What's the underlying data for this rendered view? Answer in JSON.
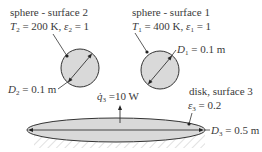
{
  "diagram": {
    "sphere2": {
      "title": "sphere - surface 2",
      "T_symbol": "T",
      "T_sub": "2",
      "T_value": " = 200 K, ",
      "eps_symbol": "ε",
      "eps_sub": "2",
      "eps_value": " = 1",
      "D_symbol": "D",
      "D_sub": "2",
      "D_value": " = 0.1 m"
    },
    "sphere1": {
      "title": "sphere - surface 1",
      "T_symbol": "T",
      "T_sub": "1",
      "T_value": " = 400 K, ",
      "eps_symbol": "ε",
      "eps_sub": "1",
      "eps_value": " = 1",
      "D_symbol": "D",
      "D_sub": "1",
      "D_value": " = 0.1 m"
    },
    "disk": {
      "title": "disk, surface 3",
      "eps_symbol": "ε",
      "eps_sub": "3",
      "eps_value": " = 0.2",
      "q_symbol": "q̇",
      "q_sub": "3",
      "q_value": " =10 W",
      "D_symbol": "D",
      "D_sub": "3",
      "D_value": " = 0.5 m"
    },
    "colors": {
      "fill": "#d9d9d9",
      "stroke": "#333333",
      "hatch": "#bdbdbd"
    }
  }
}
